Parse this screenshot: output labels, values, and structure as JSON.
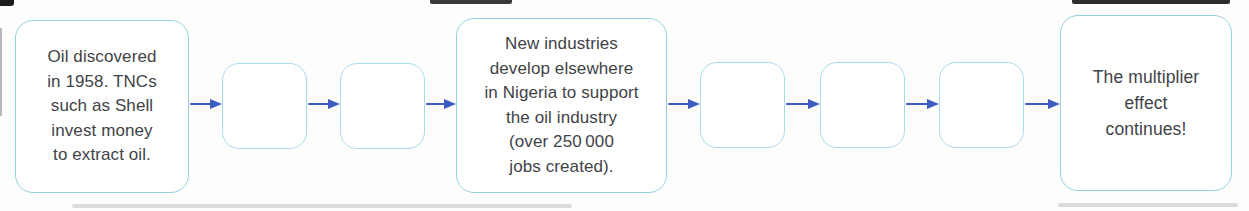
{
  "colors": {
    "background": "#fdfdfc",
    "box_fill": "#ffffff",
    "box_border_large": "#94d0e2",
    "box_border_small": "#a9dcec",
    "arrow": "#3d5cc2",
    "text": "#3f4347"
  },
  "flowchart": {
    "description": "Multiplier effect flow diagram with blank stages to fill in",
    "boxes": [
      {
        "id": "stage-1",
        "state": "filled",
        "text": "Oil discovered\nin 1958. TNCs\nsuch as Shell\ninvest money\nto extract oil."
      },
      {
        "id": "stage-2",
        "state": "blank",
        "text": ""
      },
      {
        "id": "stage-3",
        "state": "blank",
        "text": ""
      },
      {
        "id": "stage-4",
        "state": "filled",
        "text": "New industries\ndevelop elsewhere\nin Nigeria to support\nthe oil industry\n(over 250 000\njobs created)."
      },
      {
        "id": "stage-5",
        "state": "blank",
        "text": ""
      },
      {
        "id": "stage-6",
        "state": "blank",
        "text": ""
      },
      {
        "id": "stage-7",
        "state": "blank",
        "text": ""
      },
      {
        "id": "stage-8",
        "state": "filled",
        "text": "The multiplier\neffect\ncontinues!"
      }
    ],
    "arrow_count": 7
  }
}
